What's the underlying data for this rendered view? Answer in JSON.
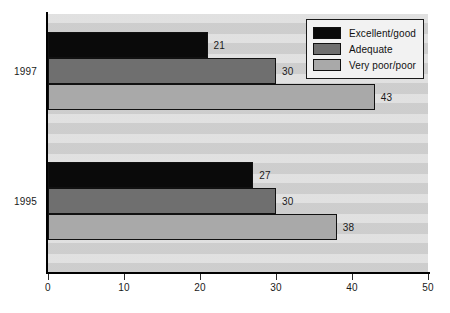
{
  "chart_data": {
    "type": "bar",
    "orientation": "horizontal",
    "title": "",
    "subtitle": "",
    "xlabel": "",
    "ylabel": "",
    "categories": [
      "1997",
      "1995"
    ],
    "series": [
      {
        "name": "Excellent/good",
        "color": "#0a0a0a",
        "values": [
          21,
          27
        ]
      },
      {
        "name": "Adequate",
        "color": "#6f6f6f",
        "values": [
          30,
          30
        ]
      },
      {
        "name": "Very poor/poor",
        "color": "#a9a9a9",
        "values": [
          43,
          38
        ]
      }
    ],
    "xlim": [
      0,
      50
    ],
    "xticks": [
      0,
      10,
      20,
      30,
      40,
      50
    ],
    "xtick_labels": [
      "0",
      "10",
      "20",
      "30",
      "40",
      "50"
    ],
    "grid": false,
    "legend_position": "top-right",
    "data_labels": [
      "21",
      "30",
      "43",
      "27",
      "30",
      "38"
    ],
    "plot_background": "#d5d5d5"
  },
  "legend": {
    "items": [
      {
        "label": "Excellent/good",
        "swatch": "black-swatch"
      },
      {
        "label": "Adequate",
        "swatch": "dark-gray-swatch"
      },
      {
        "label": "Very poor/poor",
        "swatch": "light-gray-swatch"
      }
    ]
  },
  "axis": {
    "x_tick_labels": [
      "0",
      "10",
      "20",
      "30",
      "40",
      "50"
    ],
    "y_category_labels": [
      "1997",
      "1995"
    ]
  }
}
